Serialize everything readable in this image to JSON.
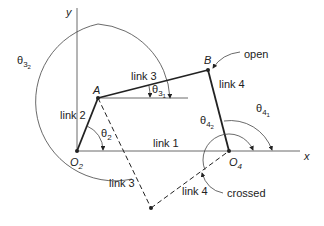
{
  "diagram": {
    "axes": {
      "x_label": "x",
      "y_label": "y"
    },
    "points": {
      "O2": {
        "label": "O",
        "sub": "2"
      },
      "O4": {
        "label": "O",
        "sub": "4"
      },
      "A": {
        "label": "A"
      },
      "B": {
        "label": "B"
      }
    },
    "links": {
      "link1": "link 1",
      "link2": "link 2",
      "link3_open": "link 3",
      "link4_open": "link 4",
      "link3_crossed": "link 3",
      "link4_crossed": "link 4"
    },
    "angles": {
      "theta2": {
        "base": "θ",
        "sub": "2"
      },
      "theta31": {
        "base": "θ",
        "sub": "3",
        "subsub": "1"
      },
      "theta32": {
        "base": "θ",
        "sub": "3",
        "subsub": "2"
      },
      "theta41": {
        "base": "θ",
        "sub": "4",
        "subsub": "1"
      },
      "theta42": {
        "base": "θ",
        "sub": "4",
        "subsub": "2"
      }
    },
    "callouts": {
      "open": "open",
      "crossed": "crossed"
    },
    "colors": {
      "line": "#222222",
      "background": "#ffffff"
    }
  }
}
